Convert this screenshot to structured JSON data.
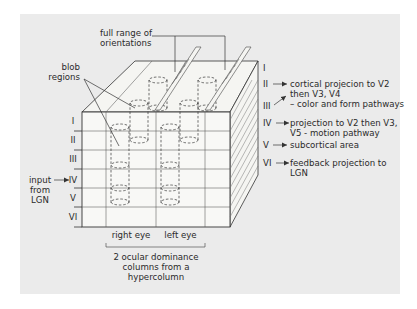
{
  "colors": {
    "panel_bg": "#ebebeb",
    "cube_face": "#f7f7f5",
    "line": "#3a3a3a"
  },
  "top_labels": {
    "orientations_line1": "full range of",
    "orientations_line2": "orientations",
    "blob_line1": "blob",
    "blob_line2": "regions"
  },
  "front_layers": [
    "I",
    "II",
    "III",
    "IV",
    "V",
    "VI"
  ],
  "side_layers": [
    "I",
    "II",
    "III",
    "IV",
    "V",
    "VI"
  ],
  "input": {
    "line1": "input",
    "line2": "from",
    "line3": "LGN",
    "arrow": "→"
  },
  "projections": [
    {
      "layer": "II",
      "line1": "cortical projecion to V2",
      "line2": "then V3, V4",
      "line3": "– color and form pathways"
    },
    {
      "layer": "IV",
      "line1": "projection to V2 then V3,",
      "line2": "V5 - motion pathway"
    },
    {
      "layer": "V",
      "line1": "subcortical area"
    },
    {
      "layer": "VI",
      "line1": "feedback projection to",
      "line2": "LGN"
    }
  ],
  "columns": {
    "right_eye": "right eye",
    "left_eye": "left eye"
  },
  "caption": {
    "line1": "2 ocular dominance",
    "line2": "columns from a",
    "line3": "hypercolumn"
  }
}
